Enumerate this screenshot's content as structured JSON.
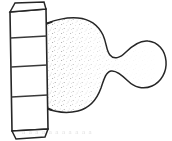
{
  "figure": {
    "background_color": "#ffffff",
    "line_color": "#262626",
    "stipple_color": "#8c8c8c",
    "width": 172,
    "height": 141,
    "caption": "a a  a a    a a   a  a a   a a",
    "column": {
      "label": "segmented-column",
      "segment_count": 4,
      "top_y": 3,
      "bottom_y": 131,
      "left_x": 9,
      "right_x": 47,
      "divider_y_values": [
        12,
        38,
        66,
        96,
        128
      ],
      "description": "tall box drawn in slight perspective, divided into horizontal bands"
    },
    "organic_form": {
      "label": "stippled-blob",
      "lobes": [
        {
          "name": "main-body",
          "center_x": 80,
          "center_y": 64,
          "radius_x": 34,
          "radius_y": 46
        },
        {
          "name": "end-lobe",
          "center_x": 146,
          "center_y": 64,
          "radius_x": 21,
          "radius_y": 27
        }
      ],
      "neck": {
        "x": 114,
        "top_y": 56,
        "bottom_y": 74
      },
      "shading": "stipple dots concentrated on the left and lower-left of the main body and along the neck"
    }
  }
}
